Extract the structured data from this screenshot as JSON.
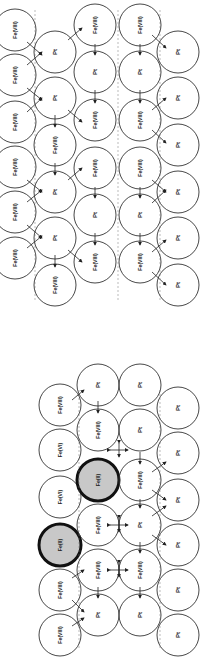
{
  "figure": {
    "orientation": "rotated-90",
    "radius": 21,
    "colors": {
      "stroke": "#333333",
      "fill": "#ffffff",
      "highlight_fill": "#c8c8c8",
      "highlight_stroke": "#111111"
    },
    "panels": [
      {
        "id": "top-lattice",
        "atoms": [
          {
            "x": 15,
            "y": 30,
            "label": "Fe(VIII)"
          },
          {
            "x": 15,
            "y": 75,
            "label": "Fe(VIII)"
          },
          {
            "x": 15,
            "y": 122,
            "label": "Fe(VIII)"
          },
          {
            "x": 15,
            "y": 167,
            "label": "Fe(VIII)"
          },
          {
            "x": 15,
            "y": 212,
            "label": "Fe(VIII)"
          },
          {
            "x": 15,
            "y": 258,
            "label": "Fe(VIII)"
          },
          {
            "x": 55,
            "y": 52,
            "label": "Pt"
          },
          {
            "x": 55,
            "y": 98,
            "label": "Pt"
          },
          {
            "x": 55,
            "y": 145,
            "label": "Fe(VIII)"
          },
          {
            "x": 55,
            "y": 192,
            "label": "Pt"
          },
          {
            "x": 55,
            "y": 238,
            "label": "Pt"
          },
          {
            "x": 55,
            "y": 285,
            "label": "Fe(VIII)"
          },
          {
            "x": 95,
            "y": 25,
            "label": "Fe(VIII)"
          },
          {
            "x": 95,
            "y": 72,
            "label": "Pt"
          },
          {
            "x": 95,
            "y": 120,
            "label": "Fe(VIII)"
          },
          {
            "x": 95,
            "y": 168,
            "label": "Fe(VIII)"
          },
          {
            "x": 95,
            "y": 215,
            "label": "Pt"
          },
          {
            "x": 95,
            "y": 262,
            "label": "Fe(VIII)"
          },
          {
            "x": 140,
            "y": 25,
            "label": "Fe(VIII)"
          },
          {
            "x": 140,
            "y": 72,
            "label": "Pt"
          },
          {
            "x": 140,
            "y": 120,
            "label": "Fe(VIII)"
          },
          {
            "x": 140,
            "y": 168,
            "label": "Fe(VIII)"
          },
          {
            "x": 140,
            "y": 215,
            "label": "Pt"
          },
          {
            "x": 140,
            "y": 262,
            "label": "Fe(VIII)"
          },
          {
            "x": 178,
            "y": 52,
            "label": "Pt"
          },
          {
            "x": 178,
            "y": 98,
            "label": "Pt"
          },
          {
            "x": 178,
            "y": 145,
            "label": "Pt"
          },
          {
            "x": 178,
            "y": 192,
            "label": "Pt"
          },
          {
            "x": 178,
            "y": 238,
            "label": "Pt"
          },
          {
            "x": 178,
            "y": 285,
            "label": "Pt"
          }
        ]
      },
      {
        "id": "bottom-lattice",
        "atoms": [
          {
            "x": 60,
            "y": 405,
            "label": "Fe(VIII)"
          },
          {
            "x": 60,
            "y": 450,
            "label": "Fe(VI)"
          },
          {
            "x": 60,
            "y": 497,
            "label": "Fe(VI)"
          },
          {
            "x": 60,
            "y": 545,
            "label": "Fe(II)",
            "highlight": true
          },
          {
            "x": 60,
            "y": 590,
            "label": "Fe(VIII)"
          },
          {
            "x": 60,
            "y": 635,
            "label": "Fe(VIII)"
          },
          {
            "x": 98,
            "y": 385,
            "label": "Pt"
          },
          {
            "x": 98,
            "y": 430,
            "label": "Fe(VIII)"
          },
          {
            "x": 98,
            "y": 480,
            "label": "Fe(II)",
            "highlight": true
          },
          {
            "x": 98,
            "y": 525,
            "label": "Fe(VIII)"
          },
          {
            "x": 98,
            "y": 570,
            "label": "Fe(VIII)"
          },
          {
            "x": 98,
            "y": 615,
            "label": "Pt"
          },
          {
            "x": 140,
            "y": 385,
            "label": "Pt"
          },
          {
            "x": 140,
            "y": 430,
            "label": "Pt"
          },
          {
            "x": 140,
            "y": 480,
            "label": "Fe(VIII)"
          },
          {
            "x": 140,
            "y": 525,
            "label": "Pt"
          },
          {
            "x": 140,
            "y": 570,
            "label": "Fe(VIII)"
          },
          {
            "x": 140,
            "y": 615,
            "label": "Pt"
          },
          {
            "x": 178,
            "y": 408,
            "label": "Pt"
          },
          {
            "x": 178,
            "y": 453,
            "label": "Pt"
          },
          {
            "x": 178,
            "y": 500,
            "label": "Pt"
          },
          {
            "x": 178,
            "y": 545,
            "label": "Pt"
          },
          {
            "x": 178,
            "y": 590,
            "label": "Pt"
          },
          {
            "x": 178,
            "y": 635,
            "label": "Pt"
          }
        ]
      }
    ],
    "bonds": [
      {
        "x1": 95,
        "y1": 47,
        "x2": 95,
        "y2": 52,
        "type": "vertical-arrow"
      },
      {
        "x1": 140,
        "y1": 47,
        "x2": 140,
        "y2": 52,
        "type": "vertical-arrow"
      },
      {
        "x1": 95,
        "y1": 93,
        "x2": 95,
        "y2": 100,
        "type": "vertical-arrow"
      },
      {
        "x1": 140,
        "y1": 93,
        "x2": 140,
        "y2": 100,
        "type": "vertical-arrow"
      },
      {
        "x1": 95,
        "y1": 190,
        "x2": 95,
        "y2": 195,
        "type": "vertical-arrow"
      },
      {
        "x1": 140,
        "y1": 190,
        "x2": 140,
        "y2": 195,
        "type": "vertical-arrow"
      },
      {
        "x1": 95,
        "y1": 236,
        "x2": 95,
        "y2": 242,
        "type": "vertical-arrow"
      },
      {
        "x1": 140,
        "y1": 236,
        "x2": 140,
        "y2": 242,
        "type": "vertical-arrow"
      },
      {
        "x1": 55,
        "y1": 118,
        "x2": 55,
        "y2": 124,
        "type": "vertical-arrow"
      },
      {
        "x1": 55,
        "y1": 166,
        "x2": 55,
        "y2": 172,
        "type": "vertical-arrow"
      },
      {
        "x1": 55,
        "y1": 258,
        "x2": 55,
        "y2": 264,
        "type": "vertical-arrow"
      },
      {
        "x1": 98,
        "y1": 404,
        "x2": 98,
        "y2": 410,
        "type": "vertical-arrow"
      },
      {
        "x1": 140,
        "y1": 455,
        "x2": 140,
        "y2": 461,
        "type": "vertical-arrow"
      },
      {
        "x1": 140,
        "y1": 502,
        "x2": 140,
        "y2": 505,
        "type": "vertical-arrow"
      },
      {
        "x1": 140,
        "y1": 545,
        "x2": 140,
        "y2": 550,
        "type": "vertical-arrow"
      },
      {
        "x1": 140,
        "y1": 590,
        "x2": 140,
        "y2": 595,
        "type": "vertical-arrow"
      },
      {
        "x1": 98,
        "y1": 590,
        "x2": 98,
        "y2": 595,
        "type": "vertical-arrow"
      }
    ],
    "cross_arrows": [
      {
        "x": 119,
        "y": 450
      },
      {
        "x": 119,
        "y": 525
      },
      {
        "x": 119,
        "y": 570
      }
    ],
    "diagonal_arrows": [
      {
        "x1": 27,
        "y1": 42,
        "x2": 42,
        "y2": 55
      },
      {
        "x1": 27,
        "y1": 65,
        "x2": 42,
        "y2": 52
      },
      {
        "x1": 27,
        "y1": 88,
        "x2": 42,
        "y2": 100
      },
      {
        "x1": 27,
        "y1": 112,
        "x2": 42,
        "y2": 98
      },
      {
        "x1": 27,
        "y1": 180,
        "x2": 42,
        "y2": 192
      },
      {
        "x1": 27,
        "y1": 202,
        "x2": 42,
        "y2": 190
      },
      {
        "x1": 27,
        "y1": 225,
        "x2": 42,
        "y2": 238
      },
      {
        "x1": 27,
        "y1": 248,
        "x2": 42,
        "y2": 236
      },
      {
        "x1": 68,
        "y1": 40,
        "x2": 82,
        "y2": 28
      },
      {
        "x1": 68,
        "y1": 110,
        "x2": 82,
        "y2": 122
      },
      {
        "x1": 68,
        "y1": 180,
        "x2": 82,
        "y2": 168
      },
      {
        "x1": 68,
        "y1": 250,
        "x2": 82,
        "y2": 262
      },
      {
        "x1": 152,
        "y1": 35,
        "x2": 166,
        "y2": 48
      },
      {
        "x1": 152,
        "y1": 110,
        "x2": 166,
        "y2": 98
      },
      {
        "x1": 152,
        "y1": 130,
        "x2": 166,
        "y2": 143
      },
      {
        "x1": 152,
        "y1": 180,
        "x2": 166,
        "y2": 192
      },
      {
        "x1": 152,
        "y1": 203,
        "x2": 166,
        "y2": 190
      },
      {
        "x1": 152,
        "y1": 252,
        "x2": 166,
        "y2": 240
      },
      {
        "x1": 152,
        "y1": 272,
        "x2": 166,
        "y2": 285
      },
      {
        "x1": 72,
        "y1": 400,
        "x2": 84,
        "y2": 390
      },
      {
        "x1": 72,
        "y1": 578,
        "x2": 84,
        "y2": 570
      },
      {
        "x1": 72,
        "y1": 600,
        "x2": 84,
        "y2": 612
      },
      {
        "x1": 72,
        "y1": 626,
        "x2": 84,
        "y2": 618
      },
      {
        "x1": 152,
        "y1": 472,
        "x2": 166,
        "y2": 462
      },
      {
        "x1": 152,
        "y1": 490,
        "x2": 166,
        "y2": 500
      },
      {
        "x1": 152,
        "y1": 535,
        "x2": 166,
        "y2": 545
      },
      {
        "x1": 152,
        "y1": 516,
        "x2": 166,
        "y2": 506
      }
    ]
  }
}
